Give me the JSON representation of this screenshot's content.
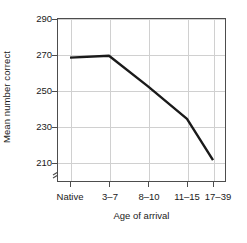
{
  "chart_data": {
    "type": "line",
    "title": "",
    "xlabel": "Age of arrival",
    "ylabel": "Mean number correct",
    "categories": [
      "Native",
      "3–7",
      "8–10",
      "11–15",
      "17–39"
    ],
    "values": [
      268,
      269,
      252,
      234,
      211
    ],
    "series": [
      {
        "name": "Mean number correct",
        "values": [
          268,
          269,
          252,
          234,
          211
        ]
      }
    ],
    "yticks": [
      290,
      270,
      250,
      230,
      210
    ],
    "ylim": [
      203,
      290
    ],
    "grid": "both",
    "legend_position": "none",
    "axis_break": {
      "axis": "y",
      "glyph": "double-slash",
      "below_value": 210
    },
    "line_color": "#1a1a1a",
    "grid_color": "#d0d0d0",
    "frame_color": "#4d4d4d",
    "background_color": "#ffffff"
  },
  "ytick_labels": [
    "290",
    "270",
    "250",
    "230",
    "210"
  ],
  "xtick_labels": [
    "Native",
    "3–7",
    "8–10",
    "11–15",
    "17–39"
  ],
  "axes": {
    "x_title": "Age of arrival",
    "y_title": "Mean number correct"
  }
}
